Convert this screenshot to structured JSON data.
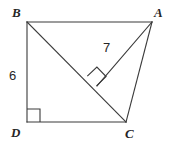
{
  "figure": {
    "background_color": "#ffffff",
    "stroke_color": "#3a3a3a",
    "text_color": "#262626",
    "vertices": {
      "B": {
        "label": "B",
        "x": 27,
        "y": 22
      },
      "A": {
        "label": "A",
        "x": 152,
        "y": 22
      },
      "D": {
        "label": "D",
        "x": 27,
        "y": 122
      },
      "C": {
        "label": "C",
        "x": 126,
        "y": 122
      },
      "F": {
        "label": "",
        "x": 97,
        "y": 86
      }
    },
    "segments": [
      {
        "name": "BA",
        "from": "B",
        "to": "A"
      },
      {
        "name": "AC",
        "from": "A",
        "to": "C"
      },
      {
        "name": "CD",
        "from": "C",
        "to": "D"
      },
      {
        "name": "DB",
        "from": "D",
        "to": "B"
      },
      {
        "name": "BC",
        "from": "B",
        "to": "C"
      },
      {
        "name": "AF",
        "from": "A",
        "to": "F"
      }
    ],
    "right_angles": [
      {
        "name": "right-angle-at-D",
        "vertex": "D",
        "size": 13
      },
      {
        "name": "right-angle-at-F",
        "vertex": "F",
        "size": 13
      }
    ],
    "measures": {
      "BD": "6",
      "AF": "7"
    }
  }
}
